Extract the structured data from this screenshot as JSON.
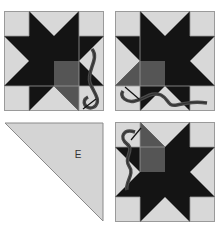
{
  "diagram": {
    "colors": {
      "background_square": "#d8d8d8",
      "star": "#141414",
      "center_highlight": "#555555",
      "grid_line": "#9a9a9a",
      "thread": "#4a4a4a",
      "triangle_fill": "#d4d4d4",
      "triangle_stroke": "#8a8a8a"
    },
    "panels": [
      {
        "id": "step-1",
        "description": "Star block with needle and thread at lower right of center square"
      },
      {
        "id": "step-2",
        "description": "Star block with thread running along bottom, center square and lower-left point highlighted"
      },
      {
        "id": "step-3",
        "description": "Triangle template piece",
        "label": "E"
      },
      {
        "id": "step-4",
        "description": "Star block with needle and thread at upper left, upper-left center square highlighted"
      }
    ]
  }
}
